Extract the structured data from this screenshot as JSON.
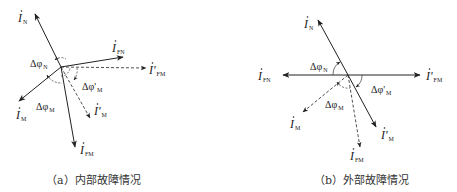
{
  "figure": {
    "panels": [
      {
        "id": "a",
        "caption": "（a）内部故障情况",
        "origin": [
          61,
          67
        ],
        "vectors": [
          {
            "name": "I_N",
            "label": "I",
            "sub": "N",
            "tip": [
              35,
              14
            ],
            "dashed": false,
            "label_pos": [
              18,
              22
            ]
          },
          {
            "name": "I_FN",
            "label": "I",
            "sub": "FN",
            "tip": [
              123,
              57
            ],
            "dashed": false,
            "label_pos": [
              112,
              52
            ]
          },
          {
            "name": "I'_FM",
            "label": "I'",
            "sub": "FM",
            "tip": [
              146,
              68
            ],
            "dashed": true,
            "label_pos": [
              149,
              74
            ]
          },
          {
            "name": "I_M",
            "label": "I",
            "sub": "M",
            "tip": [
              19,
              101
            ],
            "dashed": false,
            "label_pos": [
              16,
              119
            ]
          },
          {
            "name": "I'_M",
            "label": "I'",
            "sub": "M",
            "tip": [
              90,
              118
            ],
            "dashed": true,
            "label_pos": [
              94,
              115
            ]
          },
          {
            "name": "I_FM",
            "label": "I",
            "sub": "FM",
            "tip": [
              75,
              147
            ],
            "dashed": false,
            "label_pos": [
              80,
              154
            ]
          }
        ],
        "angles": [
          {
            "name": "delta-phi-N",
            "text": "Δφ",
            "sub": "N",
            "pos": [
              30,
              67
            ]
          },
          {
            "name": "delta-phi-prime-M",
            "text": "Δφ'",
            "sub": "M",
            "pos": [
              82,
              90
            ]
          },
          {
            "name": "delta-phi-M",
            "text": "Δφ",
            "sub": "M",
            "pos": [
              36,
              110
            ]
          }
        ]
      },
      {
        "id": "b",
        "caption": "（b）外部故障情况",
        "origin": [
          348,
          75
        ],
        "vectors": [
          {
            "name": "I_N",
            "label": "I",
            "sub": "N",
            "tip": [
              318,
              20
            ],
            "dashed": false,
            "label_pos": [
              304,
              28
            ]
          },
          {
            "name": "I'_FM",
            "label": "I'",
            "sub": "FM",
            "tip": [
              420,
              75
            ],
            "dashed": false,
            "label_pos": [
              426,
              80
            ]
          },
          {
            "name": "I_FN",
            "label": "I",
            "sub": "FN",
            "tip": [
              283,
              75
            ],
            "dashed": false,
            "label_pos": [
              258,
              80
            ]
          },
          {
            "name": "I_M",
            "label": "I",
            "sub": "M",
            "tip": [
              303,
              112
            ],
            "dashed": true,
            "label_pos": [
              290,
              128
            ]
          },
          {
            "name": "I'_M",
            "label": "I'",
            "sub": "M",
            "tip": [
              376,
              127
            ],
            "dashed": false,
            "label_pos": [
              381,
              139
            ]
          },
          {
            "name": "I_FM",
            "label": "I",
            "sub": "FM",
            "tip": [
              360,
              147
            ],
            "dashed": true,
            "label_pos": [
              350,
              160
            ]
          }
        ],
        "angles": [
          {
            "name": "delta-phi-N",
            "text": "Δφ",
            "sub": "N",
            "pos": [
              310,
              70
            ]
          },
          {
            "name": "delta-phi-prime-M",
            "text": "Δφ'",
            "sub": "M",
            "pos": [
              371,
              93
            ]
          },
          {
            "name": "delta-phi-M",
            "text": "Δφ",
            "sub": "M",
            "pos": [
              325,
              108
            ]
          }
        ]
      }
    ]
  }
}
